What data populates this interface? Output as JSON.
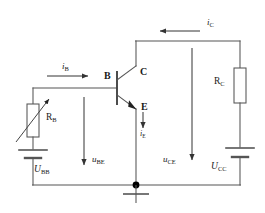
{
  "diagram": {
    "type": "circuit-schematic"
  },
  "colors": {
    "wire": "#4a4a4a",
    "label": "#1a1a1a",
    "background": "#ffffff",
    "node": "#000000"
  },
  "terminals": {
    "base": "B",
    "collector": "C",
    "emitter": "E"
  },
  "currents": {
    "base": {
      "symbol": "i",
      "sub": "B",
      "direction": "right"
    },
    "collector": {
      "symbol": "i",
      "sub": "C",
      "direction": "left"
    },
    "emitter": {
      "symbol": "i",
      "sub": "E",
      "direction": "down"
    }
  },
  "voltages": {
    "be": {
      "symbol": "u",
      "sub": "BE",
      "direction": "down"
    },
    "ce": {
      "symbol": "u",
      "sub": "CE",
      "direction": "down"
    }
  },
  "components": {
    "rb": {
      "symbol": "R",
      "sub": "B",
      "kind": "variable-resistor"
    },
    "rc": {
      "symbol": "R",
      "sub": "C",
      "kind": "resistor"
    },
    "ubb": {
      "symbol": "U",
      "sub": "BB",
      "kind": "dc-source"
    },
    "ucc": {
      "symbol": "U",
      "sub": "CC",
      "kind": "dc-source"
    }
  },
  "nodes": {
    "ground": "ground-symbol",
    "junction": "emitter-ground-junction"
  }
}
